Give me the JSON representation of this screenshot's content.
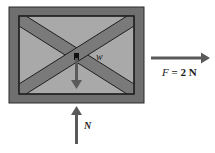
{
  "diagram": {
    "type": "free-body-diagram",
    "object": "crate",
    "forces": [
      {
        "id": "weight",
        "symbol": "w",
        "direction": "down"
      },
      {
        "id": "applied",
        "symbol": "F",
        "label": "F = 2 N",
        "value": "2 N",
        "direction": "right"
      },
      {
        "id": "normal",
        "symbol": "N",
        "direction": "up"
      }
    ]
  },
  "labels": {
    "weight": "w",
    "applied_symbol": "F",
    "applied_rest": " = 2 N",
    "normal": "N"
  },
  "colors": {
    "frame": "#6f6f6f",
    "panel": "#a9a9a9",
    "brace": "#7a7a7a",
    "arrow": "#5a5a5a",
    "outline": "#1f1f1f"
  }
}
